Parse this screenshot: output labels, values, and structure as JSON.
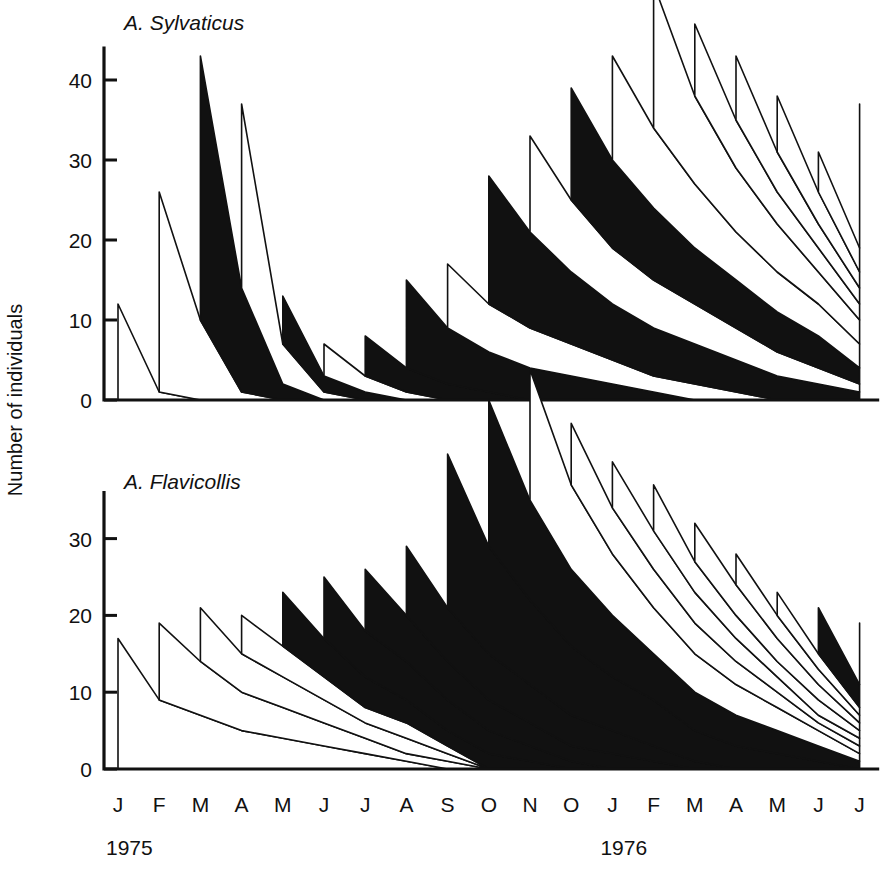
{
  "figure": {
    "y_axis_label": "Number of individuals",
    "panels": [
      {
        "id": "sylvaticus",
        "title": "A. Sylvaticus",
        "y_ticks": [
          0,
          10,
          20,
          30,
          40
        ],
        "ymax": 44
      },
      {
        "id": "flavicollis",
        "title": "A. Flavicollis",
        "y_ticks": [
          0,
          10,
          20,
          30
        ],
        "ymax": 36
      }
    ],
    "x_axis": {
      "month_labels": [
        "J",
        "F",
        "M",
        "A",
        "M",
        "J",
        "J",
        "A",
        "S",
        "O",
        "N",
        "O",
        "J",
        "F",
        "M",
        "A",
        "M",
        "J",
        "J"
      ],
      "year_labels": [
        {
          "text": "1975",
          "at_index": 0
        },
        {
          "text": "1976",
          "at_index": 12
        }
      ]
    }
  },
  "chart_data": [
    {
      "type": "area",
      "id": "sylvaticus",
      "title": "A. Sylvaticus",
      "subtitle": "",
      "xlabel": "",
      "ylabel": "Number of individuals",
      "ylim": [
        0,
        44
      ],
      "grid": false,
      "legend": "none",
      "stacking": "stacked-cohort-survivorship",
      "x": [
        "J 1975",
        "F 1975",
        "M 1975",
        "A 1975",
        "M 1975",
        "J 1975",
        "J 1975",
        "A 1975",
        "S 1975",
        "O 1975",
        "N 1975",
        "O 1975",
        "J 1976",
        "F 1976",
        "M 1976",
        "A 1976",
        "M 1976",
        "J 1976",
        "J 1976"
      ],
      "total_peaks": [
        12,
        25,
        33,
        23,
        8,
        5,
        7,
        13,
        17,
        30,
        33,
        36,
        35,
        41,
        31,
        29,
        25,
        17,
        32
      ],
      "series": [
        {
          "name": "cohort-1975-01",
          "shade": "white",
          "start_index": 0,
          "values": [
            12,
            1,
            0
          ]
        },
        {
          "name": "cohort-1975-02",
          "shade": "white",
          "start_index": 1,
          "values": [
            25,
            10,
            1,
            0
          ]
        },
        {
          "name": "cohort-1975-03",
          "shade": "black",
          "start_index": 2,
          "values": [
            33,
            13,
            2,
            0
          ]
        },
        {
          "name": "cohort-1975-04",
          "shade": "white",
          "start_index": 3,
          "values": [
            23,
            5,
            1,
            0
          ]
        },
        {
          "name": "cohort-1975-05",
          "shade": "black",
          "start_index": 4,
          "values": [
            6,
            2,
            1,
            0
          ]
        },
        {
          "name": "cohort-1975-06",
          "shade": "white",
          "start_index": 5,
          "values": [
            4,
            2,
            1,
            0
          ]
        },
        {
          "name": "cohort-1975-07",
          "shade": "black",
          "start_index": 6,
          "values": [
            5,
            3,
            2,
            1,
            0
          ]
        },
        {
          "name": "cohort-1975-08",
          "shade": "black",
          "start_index": 7,
          "values": [
            11,
            7,
            5,
            4,
            3,
            2,
            1,
            0
          ]
        },
        {
          "name": "cohort-1975-09",
          "shade": "white",
          "start_index": 8,
          "values": [
            8,
            6,
            5,
            4,
            3,
            2,
            2,
            1,
            0
          ]
        },
        {
          "name": "cohort-1975-10",
          "shade": "black",
          "start_index": 9,
          "values": [
            16,
            12,
            9,
            7,
            6,
            5,
            4,
            3,
            2,
            1,
            0
          ]
        },
        {
          "name": "cohort-1975-11",
          "shade": "white",
          "start_index": 10,
          "values": [
            12,
            9,
            7,
            6,
            5,
            4,
            3,
            2,
            1,
            0
          ]
        },
        {
          "name": "cohort-1975-12",
          "shade": "black",
          "start_index": 11,
          "values": [
            14,
            11,
            9,
            7,
            6,
            5,
            4,
            2,
            1
          ]
        },
        {
          "name": "cohort-1976-01",
          "shade": "white",
          "start_index": 12,
          "values": [
            13,
            10,
            8,
            6,
            5,
            4,
            3,
            2
          ]
        },
        {
          "name": "cohort-1976-02",
          "shade": "white",
          "start_index": 13,
          "values": [
            18,
            11,
            8,
            6,
            4,
            3,
            2
          ]
        },
        {
          "name": "cohort-1976-03",
          "shade": "white",
          "start_index": 14,
          "values": [
            9,
            6,
            4,
            3,
            2,
            1
          ]
        },
        {
          "name": "cohort-1976-04",
          "shade": "white",
          "start_index": 15,
          "values": [
            8,
            5,
            3,
            2,
            1
          ]
        },
        {
          "name": "cohort-1976-05",
          "shade": "white",
          "start_index": 16,
          "values": [
            7,
            4,
            2,
            1
          ]
        },
        {
          "name": "cohort-1976-06",
          "shade": "white",
          "start_index": 17,
          "values": [
            5,
            3,
            2
          ]
        },
        {
          "name": "cohort-1976-07",
          "shade": "black",
          "start_index": 18,
          "values": [
            18
          ]
        }
      ]
    },
    {
      "type": "area",
      "id": "flavicollis",
      "title": "A. Flavicollis",
      "subtitle": "",
      "xlabel": "",
      "ylabel": "Number of individuals",
      "ylim": [
        0,
        36
      ],
      "grid": false,
      "legend": "none",
      "stacking": "stacked-cohort-survivorship",
      "x": [
        "J 1975",
        "F 1975",
        "M 1975",
        "A 1975",
        "M 1975",
        "J 1975",
        "J 1975",
        "A 1975",
        "S 1975",
        "O 1975",
        "N 1975",
        "O 1975",
        "J 1976",
        "F 1976",
        "M 1976",
        "A 1976",
        "M 1976",
        "J 1976",
        "J 1976"
      ],
      "total_peaks": [
        17,
        19,
        16,
        12,
        15,
        16,
        16,
        19,
        32,
        33,
        34,
        22,
        15,
        15,
        14,
        11,
        9,
        12,
        8
      ],
      "series": [
        {
          "name": "cohort-1975-01",
          "shade": "white",
          "start_index": 0,
          "values": [
            17,
            9,
            7,
            5,
            4,
            3,
            2,
            1,
            0
          ]
        },
        {
          "name": "cohort-1975-02",
          "shade": "white",
          "start_index": 1,
          "values": [
            10,
            7,
            5,
            4,
            3,
            2,
            1,
            1,
            0
          ]
        },
        {
          "name": "cohort-1975-03",
          "shade": "white",
          "start_index": 2,
          "values": [
            7,
            5,
            4,
            3,
            2,
            2,
            1,
            0
          ]
        },
        {
          "name": "cohort-1975-04",
          "shade": "white",
          "start_index": 3,
          "values": [
            5,
            4,
            3,
            2,
            2,
            1,
            0
          ]
        },
        {
          "name": "cohort-1975-05",
          "shade": "black",
          "start_index": 4,
          "values": [
            7,
            5,
            4,
            3,
            2,
            2,
            1,
            0
          ]
        },
        {
          "name": "cohort-1975-06",
          "shade": "black",
          "start_index": 5,
          "values": [
            8,
            6,
            5,
            4,
            3,
            2,
            1,
            0
          ]
        },
        {
          "name": "cohort-1975-07",
          "shade": "black",
          "start_index": 6,
          "values": [
            8,
            6,
            5,
            4,
            3,
            2,
            2,
            1,
            0
          ]
        },
        {
          "name": "cohort-1975-08",
          "shade": "black",
          "start_index": 7,
          "values": [
            9,
            7,
            6,
            5,
            4,
            3,
            2,
            1,
            0
          ]
        },
        {
          "name": "cohort-1975-09",
          "shade": "black",
          "start_index": 8,
          "values": [
            20,
            14,
            11,
            9,
            7,
            6,
            4,
            3,
            2,
            1,
            0
          ]
        },
        {
          "name": "cohort-1975-10",
          "shade": "black",
          "start_index": 9,
          "values": [
            19,
            13,
            10,
            8,
            6,
            5,
            4,
            3,
            2,
            1
          ]
        },
        {
          "name": "cohort-1975-11",
          "shade": "white",
          "start_index": 10,
          "values": [
            17,
            11,
            8,
            6,
            5,
            4,
            3,
            2,
            1
          ]
        },
        {
          "name": "cohort-1975-12",
          "shade": "white",
          "start_index": 11,
          "values": [
            8,
            6,
            5,
            4,
            3,
            2,
            1,
            1
          ]
        },
        {
          "name": "cohort-1976-01",
          "shade": "white",
          "start_index": 12,
          "values": [
            6,
            5,
            4,
            3,
            2,
            1,
            1
          ]
        },
        {
          "name": "cohort-1976-02",
          "shade": "white",
          "start_index": 13,
          "values": [
            6,
            4,
            3,
            2,
            2,
            1
          ]
        },
        {
          "name": "cohort-1976-03",
          "shade": "white",
          "start_index": 14,
          "values": [
            5,
            4,
            3,
            2,
            1
          ]
        },
        {
          "name": "cohort-1976-04",
          "shade": "white",
          "start_index": 15,
          "values": [
            4,
            3,
            2,
            1
          ]
        },
        {
          "name": "cohort-1976-05",
          "shade": "white",
          "start_index": 16,
          "values": [
            3,
            2,
            1
          ]
        },
        {
          "name": "cohort-1976-06",
          "shade": "black",
          "start_index": 17,
          "values": [
            6,
            3
          ]
        },
        {
          "name": "cohort-1976-07",
          "shade": "black",
          "start_index": 18,
          "values": [
            8
          ]
        }
      ]
    }
  ]
}
